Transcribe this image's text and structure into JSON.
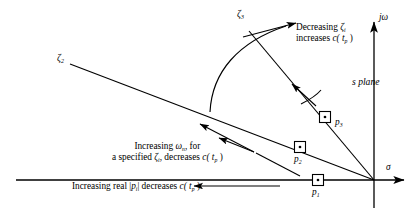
{
  "figure": {
    "title_region": "s-plane pole location effects diagram",
    "plane_label": "s  plane",
    "axes": {
      "vertical_label": "jω",
      "horizontal_label": "σ",
      "origin_x": 374,
      "origin_y": 180
    },
    "poles": [
      {
        "id": "p1",
        "label": "p",
        "sub": "1",
        "x": 318,
        "y": 180
      },
      {
        "id": "p2",
        "label": "p",
        "sub": "2",
        "x": 300,
        "y": 147
      },
      {
        "id": "p3",
        "label": "p",
        "sub": "3",
        "x": 325,
        "y": 117
      }
    ],
    "damping_rays": [
      {
        "id": "zeta2",
        "label": "ζ",
        "sub": "2",
        "label_x": 57,
        "label_y": 59
      },
      {
        "id": "zeta3",
        "label": "ζ",
        "sub": "3",
        "label_x": 237,
        "label_y": 14
      }
    ],
    "annotations": [
      {
        "id": "decreasing-zeta",
        "line1_pre": "Decreasing ",
        "line1_sym": "ζ",
        "line1_sub": "i",
        "line2_pre": "increases ",
        "line2_sym": "c",
        "line2_arg": "( t",
        "line2_sub": "p",
        "line2_post": " )"
      },
      {
        "id": "increasing-omega-n",
        "line1_pre": "Increasing ",
        "line1_sym": "ω",
        "line1_sub": "n",
        "line1_post": ", for",
        "line2_pre": "a specified ",
        "line2_sym": "ζ",
        "line2_sub": "i",
        "line2_mid": ", decreases ",
        "line2_fn": "c",
        "line2_arg": "( t",
        "line2_fnsub": "p",
        "line2_post": " )"
      },
      {
        "id": "increasing-real-p",
        "pre": "Increasing real |",
        "sym": "p",
        "sub": "i",
        "mid": "| decreases ",
        "fn": "c",
        "arg": "( t",
        "fnsub": "p",
        "post": " )"
      }
    ],
    "colors": {
      "ink": "#000000",
      "background": "#ffffff"
    }
  }
}
